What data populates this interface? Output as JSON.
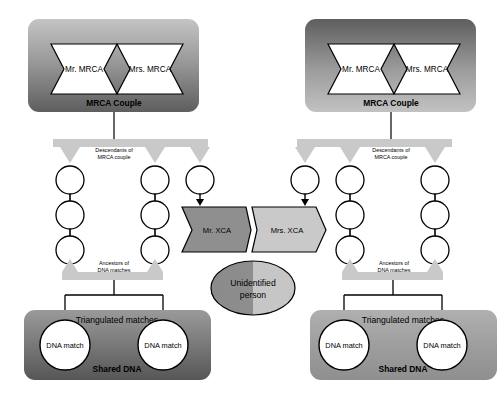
{
  "diagram": {
    "type": "genealogy-flow-diagram",
    "canvas": {
      "width": 504,
      "height": 398,
      "background": "#ffffff"
    }
  },
  "colors": {
    "mrca_box_left_top": "#bcbcbc",
    "mrca_box_left_bottom": "#6e6e6e",
    "mrca_box_right_top": "#6b6b6b",
    "mrca_box_right_bottom": "#b9b9b9",
    "shared_dna_left_top": "#8d8d8d",
    "shared_dna_left_bottom": "#5f5f5f",
    "shared_dna_right_top": "#a5a5a5",
    "shared_dna_right_bottom": "#9a9a9a",
    "xca_mr_fill": "#8f8f8f",
    "xca_mrs_fill": "#c9c9c9",
    "unidentified_left": "#8d8d8d",
    "unidentified_right": "#c2c2c2",
    "arrow_fill": "#c9c9c9",
    "node_fill": "#ffffff",
    "person_fill": "#ffffff",
    "stroke": "#000000",
    "label_text": "#000000"
  },
  "left_group": {
    "mrca_box": {
      "caption": "MRCA Couple",
      "husband": "Mr. MRCA",
      "wife": "Mrs. MRCA"
    },
    "descendants_arrow_label": "Descendants of\nMRCA couple",
    "descendants_arrow_label_line1": "Descendants of",
    "descendants_arrow_label_line2": "MRCA couple",
    "ancestors_arrow_label_line1": "Ancestors of",
    "ancestors_arrow_label_line2": "DNA matches",
    "lineages": [
      {
        "id": "left-lineage-1",
        "generations": 3
      },
      {
        "id": "left-lineage-2",
        "generations": 3
      },
      {
        "id": "left-lineage-xca",
        "generations": 1
      }
    ],
    "xca": {
      "label": "Mr. XCA"
    },
    "shared_dna_box": {
      "caption": "Shared DNA",
      "triangulation_label": "Triangulated matches",
      "matches": [
        "DNA match",
        "DNA match"
      ]
    }
  },
  "right_group": {
    "mrca_box": {
      "caption": "MRCA Couple",
      "husband": "Mr. MRCA",
      "wife": "Mrs. MRCA"
    },
    "descendants_arrow_label_line1": "Descendants of",
    "descendants_arrow_label_line2": "MRCA couple",
    "ancestors_arrow_label_line1": "Ancestors of",
    "ancestors_arrow_label_line2": "DNA matches",
    "lineages": [
      {
        "id": "right-lineage-xca",
        "generations": 1
      },
      {
        "id": "right-lineage-2",
        "generations": 3
      },
      {
        "id": "right-lineage-3",
        "generations": 3
      }
    ],
    "xca": {
      "label": "Mrs. XCA"
    },
    "shared_dna_box": {
      "caption": "Shared DNA",
      "triangulation_label": "Triangulated matches",
      "matches": [
        "DNA match",
        "DNA match"
      ]
    }
  },
  "center": {
    "unidentified_line1": "Unidentified",
    "unidentified_line2": "person"
  }
}
